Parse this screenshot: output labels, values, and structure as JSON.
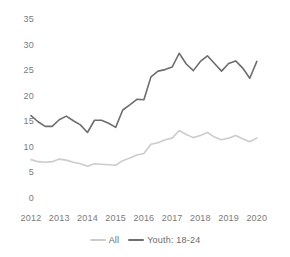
{
  "chart_data": {
    "type": "line",
    "title": "",
    "subtitle": "",
    "xlabel": "",
    "ylabel": "",
    "xlim": [
      2012,
      2020.75
    ],
    "ylim": [
      0,
      35
    ],
    "grid": false,
    "legend_position": "bottom-center",
    "y_ticks": [
      0,
      5,
      10,
      15,
      20,
      25,
      30,
      35
    ],
    "y_tick_labels": [
      "0",
      "5",
      "10",
      "15",
      "20",
      "25",
      "30",
      "35"
    ],
    "x_ticks": [
      2012,
      2013,
      2014,
      2015,
      2016,
      2017,
      2018,
      2019,
      2020
    ],
    "x_tick_labels": [
      "2012",
      "2013",
      "2014",
      "2015",
      "2016",
      "2017",
      "2018",
      "2019",
      "2020"
    ],
    "x": [
      2012,
      2012.25,
      2012.5,
      2012.75,
      2013,
      2013.25,
      2013.5,
      2013.75,
      2014,
      2014.25,
      2014.5,
      2014.75,
      2015,
      2015.25,
      2015.5,
      2015.75,
      2016,
      2016.25,
      2016.5,
      2016.75,
      2017,
      2017.25,
      2017.5,
      2017.75,
      2018,
      2018.25,
      2018.5,
      2018.75,
      2019,
      2019.25,
      2019.5,
      2019.75,
      2020
    ],
    "series": [
      {
        "name": "All",
        "color": "#cccccc",
        "values": [
          7.7,
          7.3,
          7.2,
          7.3,
          7.8,
          7.6,
          7.2,
          6.9,
          6.4,
          6.9,
          6.8,
          6.7,
          6.6,
          7.5,
          8.0,
          8.6,
          8.9,
          10.7,
          11.0,
          11.6,
          11.9,
          13.4,
          12.6,
          12.0,
          12.4,
          13.0,
          12.1,
          11.6,
          11.9,
          12.4,
          11.8,
          11.2,
          11.9
        ]
      },
      {
        "name": "Youth: 18-24",
        "color": "#6e6e6e",
        "values": [
          16.3,
          15.1,
          14.2,
          14.2,
          15.5,
          16.2,
          15.3,
          14.5,
          13.0,
          15.4,
          15.4,
          14.8,
          14.0,
          17.4,
          18.4,
          19.5,
          19.4,
          23.9,
          25.0,
          25.3,
          25.8,
          28.5,
          26.4,
          25.1,
          26.9,
          28.0,
          26.5,
          25.0,
          26.5,
          27.0,
          25.6,
          23.6,
          26.9
        ]
      }
    ]
  },
  "legend": {
    "items": [
      {
        "label": "All",
        "color": "#cccccc"
      },
      {
        "label": "Youth: 18-24",
        "color": "#6e6e6e"
      }
    ]
  },
  "axis_colors": {
    "tick_text": "#7a7a7a"
  }
}
